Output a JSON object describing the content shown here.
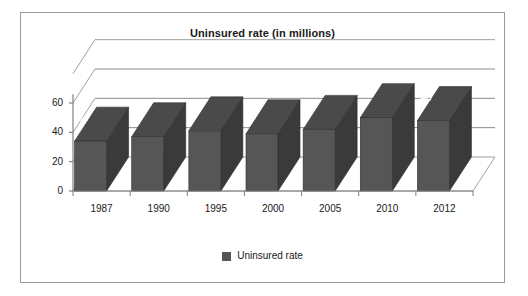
{
  "chart_data": {
    "type": "bar",
    "title": "Uninsured rate (in millions)",
    "xlabel": "",
    "ylabel": "",
    "categories": [
      "1987",
      "1990",
      "1995",
      "2000",
      "2005",
      "2010",
      "2012"
    ],
    "values": [
      34,
      37,
      41,
      39,
      42,
      50,
      48
    ],
    "point_labels": [
      "34",
      "",
      "",
      "",
      "",
      "",
      "48"
    ],
    "series": [
      {
        "name": "Uninsured rate",
        "values": [
          34,
          37,
          41,
          39,
          42,
          50,
          48
        ]
      }
    ],
    "ylim": [
      0,
      60
    ],
    "yticks": [
      0,
      20,
      40,
      60
    ],
    "ytick_labels": [
      "0",
      "20",
      "40",
      "60"
    ],
    "grid": true,
    "grid_axis": "y",
    "three_d": true,
    "legend": {
      "position": "bottom",
      "entries": [
        {
          "label": "Uninsured rate",
          "color": "#565656"
        }
      ]
    },
    "colors": {
      "bar_front": "#565656",
      "bar_side": "#3a3a3a",
      "bar_top": "#4a4a4a",
      "grid_line": "#8c8c8c",
      "axis_line": "#808080",
      "wall_line": "#a0a0a0",
      "border": "#9a9a9a",
      "text": "#1a1a1a",
      "data_label": "#ffffff"
    }
  },
  "legend": {
    "entry_label": "Uninsured rate"
  }
}
